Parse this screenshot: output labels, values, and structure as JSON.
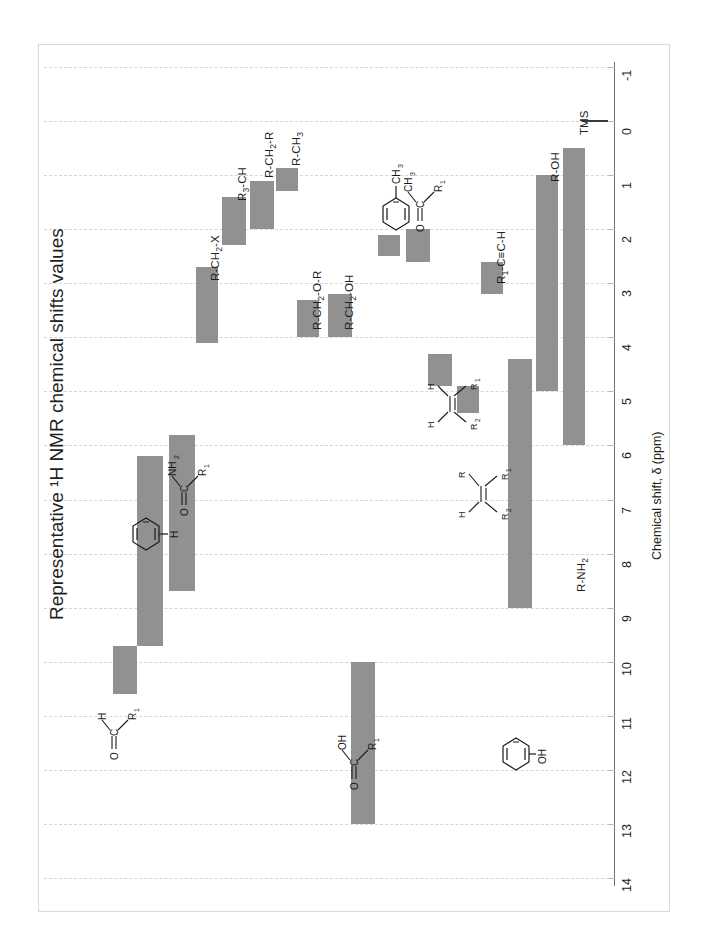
{
  "chart_title": "Representative ¹H NMR chemical shifts values",
  "axis": {
    "label": "Chemical shift, δ (ppm)",
    "ticks": [
      "-1",
      "0",
      "1",
      "2",
      "3",
      "4",
      "5",
      "6",
      "7",
      "8",
      "9",
      "10",
      "11",
      "12",
      "13",
      "14"
    ],
    "min": -1,
    "max": 14,
    "direction": "increasing-downward"
  },
  "colors": {
    "bar": "#919191",
    "grid": "#cfd6dd",
    "axis": "#6f6f6f",
    "text": "#231f20",
    "frame": "#d9d9d9"
  },
  "chart_data": {
    "type": "bar",
    "orientation": "ranges-on-vertical-axis",
    "title": "Representative ¹H NMR chemical shifts values",
    "xlabel": "",
    "ylabel": "Chemical shift, δ (ppm)",
    "ylim": [
      -1,
      14
    ],
    "grid": true,
    "legend": "none",
    "categories": [
      "R-CH₃",
      "R-CH₂-R",
      "R₃-CH",
      "R-CH₂-X",
      "R-CH₂-O-R",
      "R-CH₂-OH",
      "Ar-CH₃",
      "R₁-CO-CH₃",
      "R₁-C≡C-H",
      "Ar-H (alkene R₁/H)",
      "alkene R₁R₂C=CHR",
      "Ar-H",
      "R₁-CO-NH₂",
      "R₁-CHO",
      "R₁-COOH",
      "Ar-OH (phenol)",
      "R-OH",
      "R-NH₂",
      "TMS"
    ],
    "ranges_ppm": [
      {
        "label": "R-CH₃",
        "start": 0.87,
        "end": 1.3
      },
      {
        "label": "R-CH₂-R",
        "start": 1.1,
        "end": 2.0
      },
      {
        "label": "R₃-CH",
        "start": 1.4,
        "end": 2.3
      },
      {
        "label": "R-CH₂-X",
        "start": 2.7,
        "end": 4.1
      },
      {
        "label": "R-CH₂-O-R",
        "start": 3.3,
        "end": 4.0
      },
      {
        "label": "R-CH₂-OH",
        "start": 3.2,
        "end": 4.0
      },
      {
        "label": "Ar-CH₃",
        "start": 2.1,
        "end": 2.5
      },
      {
        "label": "R₁-CO-CH₃",
        "start": 2.0,
        "end": 2.6
      },
      {
        "label": "R₁-C≡C-H",
        "start": 2.6,
        "end": 3.2
      },
      {
        "label": "alkene-H (ring)",
        "start": 4.3,
        "end": 4.9
      },
      {
        "label": "alkene-H",
        "start": 4.9,
        "end": 5.4
      },
      {
        "label": "Ar-H",
        "start": 6.2,
        "end": 9.7
      },
      {
        "label": "R₁-CO-NH₂",
        "start": 5.8,
        "end": 8.7
      },
      {
        "label": "R₁-CHO",
        "start": 9.7,
        "end": 10.6
      },
      {
        "label": "R₁-COOH",
        "start": 10.0,
        "end": 13.0
      },
      {
        "label": "Ar-OH (phenol)",
        "start": 4.4,
        "end": 9.0
      },
      {
        "label": "R-OH",
        "start": 1.0,
        "end": 5.0
      },
      {
        "label": "R-NH₂",
        "start": 0.5,
        "end": 6.0
      },
      {
        "label": "TMS",
        "start": 0.0,
        "end": 0.0
      }
    ]
  },
  "labels": {
    "r_ch3": "R-CH",
    "r_ch3_sub": "3",
    "r_ch2_r": "R-CH",
    "r_ch2_r_sub": "2",
    "r_ch2_r_tail": "-R",
    "r3_ch": "R",
    "r3_ch_sub": "3",
    "r3_ch_tail": "-CH",
    "r_ch2_x": "R-CH",
    "r_ch2_x_sub": "2",
    "r_ch2_x_tail": "-X",
    "r_ch2_or": "R-CH",
    "r_ch2_or_sub": "2",
    "r_ch2_or_tail": "-O-R",
    "r_ch2_oh": "R-CH",
    "r_ch2_oh_sub": "2",
    "r_ch2_oh_tail": "-OH",
    "alkyne": "R",
    "alkyne_sub": "1",
    "alkyne_tail": "-C≡C-H",
    "r_oh": "R-OH",
    "r_nh2": "R-NH",
    "r_nh2_sub": "2",
    "tms": "TMS"
  },
  "structures": {
    "toluene": {
      "name": "methyl-benzene",
      "atoms": [
        "CH",
        "3"
      ]
    },
    "ketone": {
      "name": "methyl-ketone",
      "atoms": [
        "O",
        "C",
        "CH",
        "3",
        "R",
        "1"
      ]
    },
    "alkene_ring": {
      "name": "alkene-terminal",
      "atoms": [
        "H",
        "H",
        "R",
        "2",
        "R",
        "1"
      ]
    },
    "alkene_tri": {
      "name": "alkene-trisubstituted",
      "atoms": [
        "H",
        "R",
        "R",
        "2",
        "R",
        "1"
      ]
    },
    "benzene_h": {
      "name": "benzene-aromatic-H",
      "atoms": [
        "H"
      ]
    },
    "amide": {
      "name": "primary-amide",
      "atoms": [
        "O",
        "C",
        "NH",
        "2",
        "R",
        "1"
      ]
    },
    "aldehyde": {
      "name": "aldehyde",
      "atoms": [
        "O",
        "C",
        "H",
        "R",
        "1"
      ]
    },
    "carboxylic": {
      "name": "carboxylic-acid",
      "atoms": [
        "O",
        "C",
        "OH",
        "R",
        "1"
      ]
    },
    "phenol": {
      "name": "phenol",
      "atoms": [
        "OH"
      ]
    }
  }
}
